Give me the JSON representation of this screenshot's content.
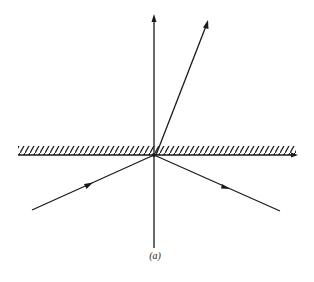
{
  "figure": {
    "caption": "(a)",
    "colors": {
      "ink": "#1a1a1a",
      "background": "#ffffff"
    }
  },
  "elements": {
    "normal": {
      "label": "normal line",
      "x": 154,
      "y_top": 15,
      "y_bottom": 248,
      "arrow": "up"
    },
    "interface": {
      "label": "interface surface",
      "y": 155,
      "x_left": 18,
      "x_right": 298,
      "hatching": "above",
      "arrow": "right"
    },
    "incident_ray": {
      "label": "incident ray",
      "from": [
        32,
        210
      ],
      "to": [
        154,
        155
      ],
      "arrow_at": [
        90,
        184
      ]
    },
    "reflected_ray": {
      "label": "reflected ray",
      "from": [
        154,
        155
      ],
      "to": [
        280,
        211
      ],
      "arrow_at": [
        228,
        188
      ]
    },
    "refracted_ray": {
      "label": "refracted ray",
      "from": [
        156,
        155
      ],
      "to": [
        208,
        20
      ],
      "arrow": "tip"
    }
  }
}
